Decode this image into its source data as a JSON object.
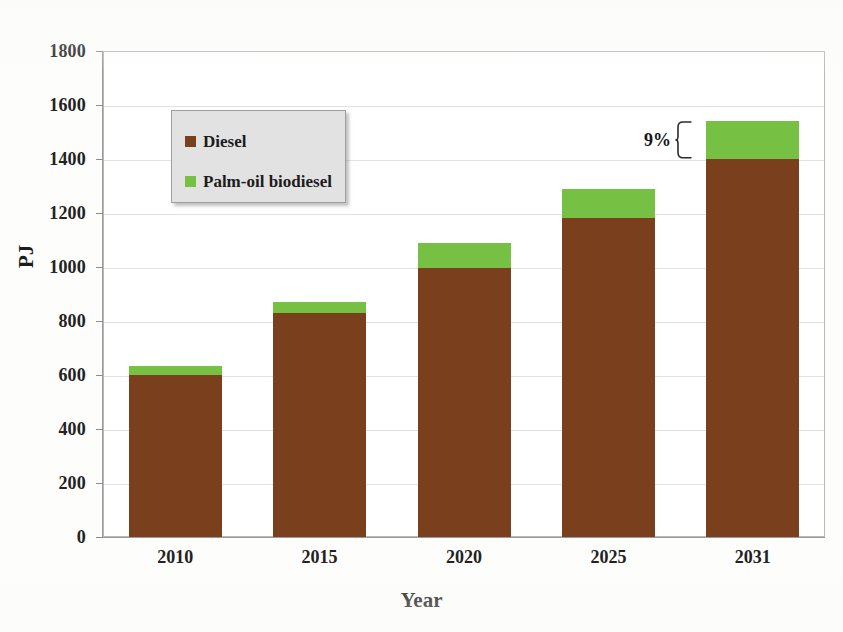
{
  "chart_data": {
    "type": "bar",
    "subtype": "stacked-bar",
    "title": "",
    "xlabel": "Year",
    "ylabel": "PJ",
    "categories": [
      "2010",
      "2015",
      "2020",
      "2025",
      "2031"
    ],
    "series": [
      {
        "name": "Diesel",
        "color": "#7a3f1d",
        "values": [
          600,
          830,
          995,
          1180,
          1400
        ]
      },
      {
        "name": "Palm-oil biodiesel",
        "color": "#76c043",
        "values": [
          35,
          40,
          95,
          110,
          140
        ]
      }
    ],
    "totals": [
      635,
      870,
      1090,
      1290,
      1540
    ],
    "ylim": [
      0,
      1800
    ],
    "ytick_step": 200,
    "yticks": [
      "1800",
      "1600",
      "1400",
      "1200",
      "1000",
      "800",
      "600",
      "400",
      "200",
      "0"
    ],
    "grid": true,
    "legend_position": "upper-left",
    "annotations": [
      {
        "text": "9%",
        "target_category": "2031",
        "target_series": "Palm-oil biodiesel",
        "style": "curly-brace"
      }
    ]
  },
  "axes": {
    "y_title": "PJ",
    "x_title": "Year",
    "y_tick_labels": [
      "1800",
      "1600",
      "1400",
      "1200",
      "1000",
      "800",
      "600",
      "400",
      "200",
      "0"
    ],
    "x_tick_labels": [
      "2010",
      "2015",
      "2020",
      "2025",
      "2031"
    ]
  },
  "legend": {
    "items": [
      {
        "label": "Diesel",
        "color": "#7a3f1d"
      },
      {
        "label": "Palm-oil biodiesel",
        "color": "#76c043"
      }
    ]
  },
  "annotation": {
    "percent_label": "9%"
  },
  "colors": {
    "diesel": "#7a3f1d",
    "biodiesel": "#76c043",
    "gridline": "#e2e2e2",
    "frame": "#b9b9b9",
    "legend_background": "#e2e2e2",
    "text": "#1c1c1c"
  }
}
